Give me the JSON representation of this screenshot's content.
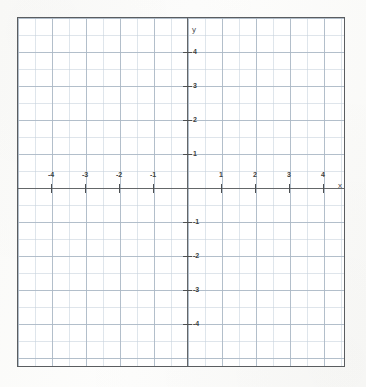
{
  "figure": {
    "background_color": "#fdfdfc",
    "frame_color": "#5a5d60",
    "axis_color": "#646769",
    "grid_minor_color": "#c4d0db",
    "grid_major_color": "#abb8c5",
    "label_color": "#3c3f41"
  },
  "axes": {
    "x_name": "x",
    "y_name": "y"
  },
  "chart_data": {
    "type": "scatter",
    "title": "",
    "subtitle": "",
    "xlabel": "x",
    "ylabel": "y",
    "xlim": [
      -5,
      4.7
    ],
    "ylim": [
      -5,
      4.8
    ],
    "xticks": [
      -4,
      -3,
      -2,
      -1,
      1,
      2,
      3,
      4
    ],
    "yticks": [
      4,
      3,
      2,
      1,
      -1,
      -2,
      -3,
      -4
    ],
    "xtick_labels": [
      "-4",
      "-3",
      "-2",
      "-1",
      "1",
      "2",
      "3",
      "4"
    ],
    "ytick_labels": [
      "4",
      "3",
      "2",
      "1",
      "-1",
      "-2",
      "-3",
      "-4"
    ],
    "grid": true,
    "grid_minor": true,
    "minor_per_major": 2,
    "legend": null,
    "series": [],
    "x": [],
    "values": [],
    "annotations": []
  },
  "ticks": {
    "x": [
      {
        "label": "-4",
        "value": -4,
        "px": 33
      },
      {
        "label": "-3",
        "value": -3,
        "px": 67
      },
      {
        "label": "-2",
        "value": -2,
        "px": 101
      },
      {
        "label": "-1",
        "value": -1,
        "px": 135
      },
      {
        "label": "1",
        "value": 1,
        "px": 203
      },
      {
        "label": "2",
        "value": 2,
        "px": 237
      },
      {
        "label": "3",
        "value": 3,
        "px": 271
      },
      {
        "label": "4",
        "value": 4,
        "px": 305
      }
    ],
    "y": [
      {
        "label": "4",
        "value": 4,
        "px": 34
      },
      {
        "label": "3",
        "value": 3,
        "px": 68
      },
      {
        "label": "2",
        "value": 2,
        "px": 102
      },
      {
        "label": "1",
        "value": 1,
        "px": 136
      },
      {
        "label": "-1",
        "value": -1,
        "px": 204
      },
      {
        "label": "-2",
        "value": -2,
        "px": 238
      },
      {
        "label": "-3",
        "value": -3,
        "px": 272
      },
      {
        "label": "-4",
        "value": -4,
        "px": 306
      }
    ]
  }
}
